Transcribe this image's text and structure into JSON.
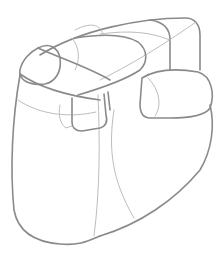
{
  "image": {
    "subject": "Pencil construction sketch of a clenched fist built from simple boxes and cylinders",
    "style": "gray line art on white"
  },
  "colors": {
    "background": "#ffffff",
    "stroke_main": "#8a8a8a",
    "stroke_light": "#b4b4b4"
  }
}
